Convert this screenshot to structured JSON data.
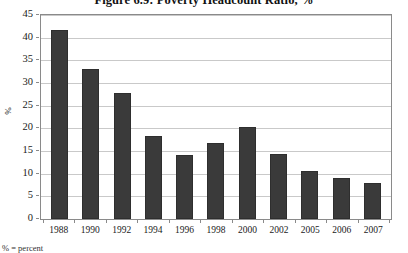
{
  "chart_data": {
    "type": "bar",
    "title": "Figure 6.9: Poverty Headcount Ratio, %",
    "xlabel": "",
    "ylabel": "%",
    "categories": [
      "1988",
      "1990",
      "1992",
      "1994",
      "1996",
      "1998",
      "2000",
      "2002",
      "2005",
      "2006",
      "2007"
    ],
    "values": [
      41.8,
      33.0,
      27.9,
      18.3,
      14.2,
      16.8,
      20.3,
      14.3,
      10.7,
      9.0,
      7.9
    ],
    "ylim": [
      0,
      45
    ],
    "ytick_step": 5,
    "yticks": [
      "45",
      "40",
      "35",
      "30",
      "25",
      "20",
      "15",
      "10",
      "5",
      "0"
    ],
    "grid": true,
    "legend": false,
    "bar_color": "#3a3a3a",
    "gridline_color": "#c9c9c9",
    "axis_color": "#8a8a8a",
    "plot_background": "#ffffff"
  },
  "footnote": {
    "text": "% = percent"
  }
}
